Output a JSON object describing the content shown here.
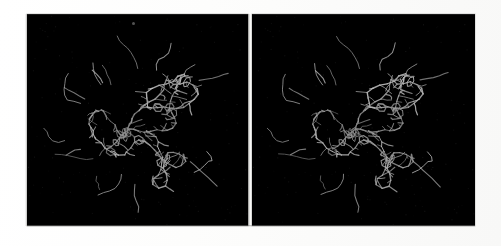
{
  "figure": {
    "type": "stereo-pair-image",
    "caption": "",
    "width_px": 501,
    "height_px": 246,
    "page_background_color": "#fbfbfa"
  },
  "panels": [
    {
      "id": "panel-left",
      "eye": "left",
      "label": "",
      "background_color": "#000000",
      "x_px": 27,
      "y_px": 14,
      "width_px": 221,
      "height_px": 212,
      "bond_color": "#d8d8d8",
      "bond_color_dim": "#8e8e8e",
      "bond_color_bright": "#f2f2f2",
      "rotation_deg": 0,
      "seed": 20347,
      "structure_center": [
        0.52,
        0.54
      ],
      "structure_radius": [
        0.4,
        0.36
      ],
      "residue_count": 128,
      "noise_density": 0.22
    },
    {
      "id": "panel-right",
      "eye": "right",
      "label": "",
      "background_color": "#000000",
      "x_px": 252,
      "y_px": 14,
      "width_px": 223,
      "height_px": 212,
      "bond_color": "#d8d8d8",
      "bond_color_dim": "#8e8e8e",
      "bond_color_bright": "#f2f2f2",
      "rotation_deg": 6,
      "seed": 20347,
      "structure_center": [
        0.5,
        0.54
      ],
      "structure_radius": [
        0.4,
        0.36
      ],
      "residue_count": 128,
      "noise_density": 0.22
    }
  ],
  "separator": {
    "name": "panel-gap",
    "x_px": 248,
    "width_px": 4,
    "color": "#f2f2f0"
  },
  "artifacts": {
    "speck": {
      "x_px": 132,
      "y_px": 22,
      "size_px": 3,
      "color": "#969696"
    }
  }
}
